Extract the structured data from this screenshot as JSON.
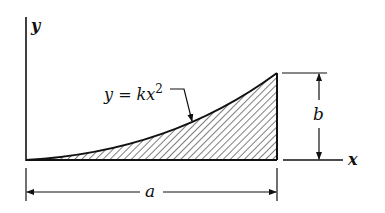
{
  "diagram": {
    "type": "area-under-parabola",
    "curve_label": "y = kx",
    "curve_exponent": "2",
    "y_axis_label": "y",
    "x_axis_label": "x",
    "width_dimension_label": "a",
    "height_dimension_label": "b",
    "colors": {
      "ink": "#111111",
      "background": "#ffffff"
    }
  }
}
